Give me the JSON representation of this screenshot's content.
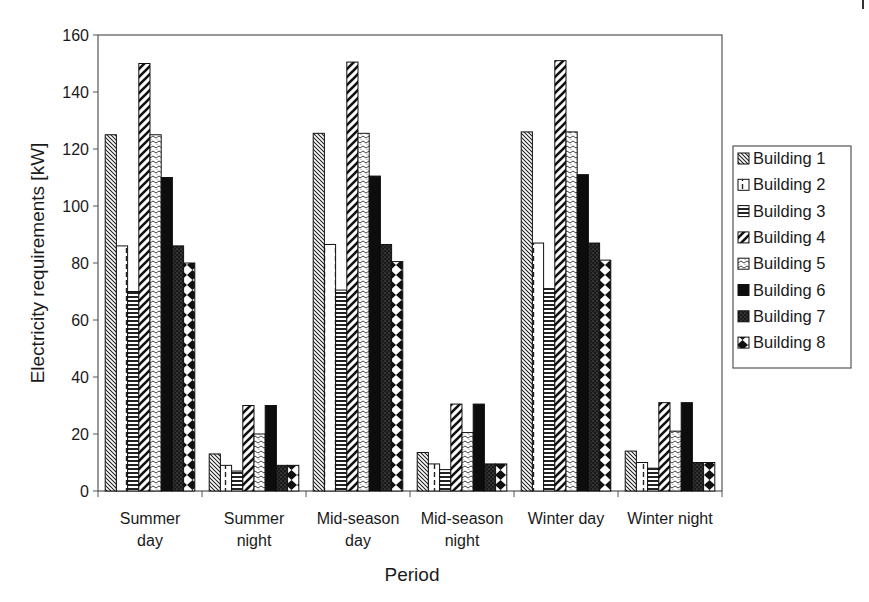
{
  "chart_data": {
    "type": "bar",
    "title": "",
    "xlabel": "Period",
    "ylabel": "Electricity requirements [kW]",
    "ylim": [
      0,
      160
    ],
    "yticks": [
      0,
      20,
      40,
      60,
      80,
      100,
      120,
      140,
      160
    ],
    "grid": false,
    "legend_position": "right",
    "categories": [
      [
        "Summer",
        "day"
      ],
      [
        "Summer",
        "night"
      ],
      [
        "Mid-season",
        "day"
      ],
      [
        "Mid-season",
        "night"
      ],
      [
        "Winter day"
      ],
      [
        "Winter night"
      ]
    ],
    "category_labels": [
      "Summer day",
      "Summer night",
      "Mid-season day",
      "Mid-season night",
      "Winter day",
      "Winter night"
    ],
    "series": [
      {
        "name": "Building 1",
        "pattern": "diag-thin",
        "values": [
          125,
          13,
          125.5,
          13.5,
          126,
          14
        ]
      },
      {
        "name": "Building 2",
        "pattern": "dashed-vertical",
        "values": [
          86,
          9,
          86.5,
          9.5,
          87,
          10
        ]
      },
      {
        "name": "Building 3",
        "pattern": "horizontal-stripes",
        "values": [
          70,
          7,
          70.5,
          7.5,
          71,
          8
        ]
      },
      {
        "name": "Building 4",
        "pattern": "diag-wide",
        "values": [
          150,
          30,
          150.5,
          30.5,
          151,
          31
        ]
      },
      {
        "name": "Building 5",
        "pattern": "zigzag",
        "values": [
          125,
          20,
          125.5,
          20.5,
          126,
          21
        ]
      },
      {
        "name": "Building 6",
        "pattern": "solid-black",
        "values": [
          110,
          30,
          110.5,
          30.5,
          111,
          31
        ]
      },
      {
        "name": "Building 7",
        "pattern": "dark-dots",
        "values": [
          86,
          9,
          86.5,
          9.5,
          87,
          10
        ]
      },
      {
        "name": "Building 8",
        "pattern": "diamonds",
        "values": [
          80,
          9,
          80.5,
          9.5,
          81,
          10
        ]
      }
    ]
  }
}
